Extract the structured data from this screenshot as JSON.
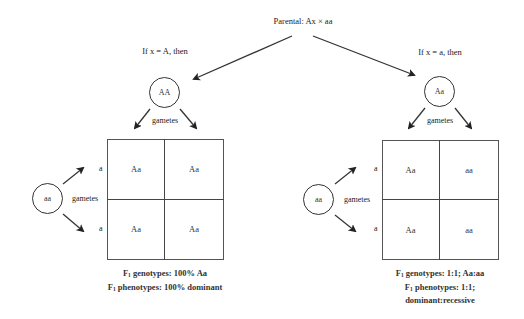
{
  "title": "Parental: Ax × aa",
  "left_case": {
    "condition": "If x = A, then",
    "parent1": "AA",
    "parent2": "aa",
    "gametes_label_top": "gametes",
    "gametes_label_side": "gametes",
    "row_gametes": [
      "a",
      "a"
    ],
    "cells": [
      [
        "Aa",
        "Aa"
      ],
      [
        "Aa",
        "Aa"
      ]
    ],
    "summary_line1_prefix": "F",
    "summary_line1_sub": "1",
    "summary_line1_text": " genotypes: 100% Aa",
    "summary_line2_prefix": "F",
    "summary_line2_sub": "1",
    "summary_line2_text": " phenotypes: 100% dominant"
  },
  "right_case": {
    "condition": "If x = a, then",
    "parent1": "Aa",
    "parent2": "aa",
    "gametes_label_top": "gametes",
    "gametes_label_side": "gametes",
    "row_gametes": [
      "a",
      "a"
    ],
    "cells": [
      [
        "Aa",
        "aa"
      ],
      [
        "Aa",
        "aa"
      ]
    ],
    "summary_line1_prefix": "F",
    "summary_line1_sub": "1",
    "summary_line1_text": " genotypes: 1:1; Aa:aa",
    "summary_line2_prefix": "F",
    "summary_line2_sub": "1",
    "summary_line2_text": " phenotypes: 1:1;",
    "summary_line3_text": "dominant:recessive"
  },
  "colors": {
    "line": "#333333",
    "text": "#222222",
    "background": "#ffffff"
  }
}
